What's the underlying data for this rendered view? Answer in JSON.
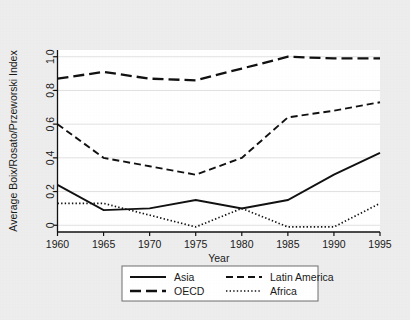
{
  "chart_data": {
    "type": "line",
    "title": "",
    "xlabel": "Year",
    "ylabel": "Average Boix/Rosato/Przeworski Index",
    "x": [
      1960,
      1965,
      1970,
      1975,
      1980,
      1985,
      1990,
      1995
    ],
    "xlim": [
      1960,
      1995
    ],
    "ylim": [
      -0.04,
      1.04
    ],
    "xticks": [
      "1960",
      "1965",
      "1970",
      "1975",
      "1980",
      "1985",
      "1990",
      "1995"
    ],
    "yticks": [
      "0",
      "0.2",
      "0.4",
      "0.6",
      "0.8",
      "1.0"
    ],
    "ytick_values": [
      0,
      0.2,
      0.4,
      0.6,
      0.8,
      1.0
    ],
    "grid": "horizontal",
    "legend_position": "below-plot",
    "series": [
      {
        "name": "Asia",
        "style": "solid",
        "values": [
          0.24,
          0.09,
          0.1,
          0.15,
          0.1,
          0.15,
          0.3,
          0.43
        ]
      },
      {
        "name": "Latin America",
        "style": "dashed",
        "values": [
          0.6,
          0.4,
          0.35,
          0.3,
          0.4,
          0.64,
          0.68,
          0.73
        ]
      },
      {
        "name": "OECD",
        "style": "long-dashed",
        "values": [
          0.87,
          0.91,
          0.87,
          0.86,
          0.93,
          1.0,
          0.99,
          0.99
        ]
      },
      {
        "name": "Africa",
        "style": "dotted",
        "values": [
          0.13,
          0.13,
          0.06,
          -0.01,
          0.1,
          -0.01,
          -0.01,
          0.13
        ]
      }
    ]
  },
  "legend": {
    "entries": [
      {
        "label": "Asia",
        "style": "solid"
      },
      {
        "label": "Latin America",
        "style": "dashed"
      },
      {
        "label": "OECD",
        "style": "long-dashed"
      },
      {
        "label": "Africa",
        "style": "dotted"
      }
    ]
  },
  "colors": {
    "background": "#ededed",
    "plot_background": "#ffffff",
    "line": "#111111",
    "grid": "#d9d9d9",
    "axis": "#111111"
  }
}
